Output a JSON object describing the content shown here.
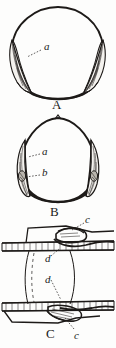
{
  "plate": {
    "title": "Anatomical illustration plate",
    "background_color": "#fdfdfc",
    "ink_color": "#1d1a18",
    "width": 116,
    "height": 348
  },
  "figures": [
    {
      "id": "figure-a",
      "caption": "A",
      "caption_x": 54,
      "caption_y": 98,
      "description": "Rounded ovoid body in outline with two pointed, finely hatched lateral lobes at lower left and lower right",
      "labels": [
        {
          "id": "label-a",
          "text": "a",
          "x": 44,
          "y": 47,
          "target_x": 24,
          "target_y": 57
        }
      ]
    },
    {
      "id": "figure-b",
      "caption": "B",
      "caption_x": 52,
      "caption_y": 206,
      "description": "Dome or bell shaped body with pointed apex and rounded base, bearing slender hatched lobes on each side",
      "labels": [
        {
          "id": "label-a",
          "text": "a",
          "x": 42,
          "y": 151,
          "target_x": 27,
          "target_y": 155
        },
        {
          "id": "label-b",
          "text": "b",
          "x": 42,
          "y": 172,
          "target_x": 24,
          "target_y": 176
        }
      ]
    },
    {
      "id": "figure-c",
      "caption": "C",
      "caption_x": 48,
      "caption_y": 330,
      "description": "Two horizontal banded bars joined by a pair of curved vertical strands, each bar carrying an interlocking hook or clasp structure",
      "labels": [
        {
          "id": "label-c-top",
          "text": "c",
          "x": 86,
          "y": 219,
          "target_x": 72,
          "target_y": 229
        },
        {
          "id": "label-d-upper",
          "text": "d",
          "x": 46,
          "y": 258,
          "target_x": 58,
          "target_y": 246
        },
        {
          "id": "label-d-lower",
          "text": "d",
          "x": 46,
          "y": 279,
          "target_x": 60,
          "target_y": 301
        },
        {
          "id": "label-c-bottom",
          "text": "c",
          "x": 76,
          "y": 332,
          "target_x": 64,
          "target_y": 317
        }
      ]
    }
  ],
  "typography": {
    "label_font_size_px": 11,
    "caption_font_size_px": 13
  }
}
